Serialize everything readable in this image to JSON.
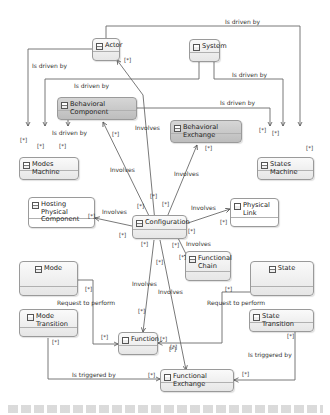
{
  "diagram": {
    "nodes": [
      {
        "id": "actor",
        "label": "Actor"
      },
      {
        "id": "system",
        "label": "System"
      },
      {
        "id": "behavioral_component",
        "label": "Behavioral Component"
      },
      {
        "id": "behavioral_exchange",
        "label": "Behavioral Exchange"
      },
      {
        "id": "modes_machine",
        "label": "Modes Machine"
      },
      {
        "id": "states_machine",
        "label": "States Machine"
      },
      {
        "id": "hosting_physical_component",
        "label": "Hosting Physical Component"
      },
      {
        "id": "configuration",
        "label": "Configuration"
      },
      {
        "id": "physical_link",
        "label": "Physical Link"
      },
      {
        "id": "functional_chain",
        "label": "Functional Chain"
      },
      {
        "id": "mode",
        "label": "Mode"
      },
      {
        "id": "state",
        "label": "State"
      },
      {
        "id": "mode_transition",
        "label": "Mode Transition"
      },
      {
        "id": "state_transition",
        "label": "State Transition"
      },
      {
        "id": "function",
        "label": "Function"
      },
      {
        "id": "functional_exchange",
        "label": "Functional Exchange"
      }
    ],
    "edge_labels": {
      "is_driven_by_top": "Is driven by",
      "is_driven_by_actor": "Is driven by",
      "is_driven_by_system": "Is driven by",
      "is_driven_by_mid": "Is driven by",
      "is_driven_by_bc_right": "Is driven by",
      "is_driven_by_bc_down": "Is driven by",
      "involves_actor": "Involves",
      "involves_bc": "Involves",
      "involves_be": "Involves",
      "involves_hpc": "Involves",
      "involves_pl": "Involves",
      "involves_fc": "Involves",
      "involves_function": "Involves",
      "involves_fe": "Involves",
      "request_mode": "Request to perform",
      "request_state": "Request to perform",
      "triggered_mode": "Is triggered by",
      "triggered_state": "Is triggered by"
    },
    "multiplicity": "[*]"
  }
}
